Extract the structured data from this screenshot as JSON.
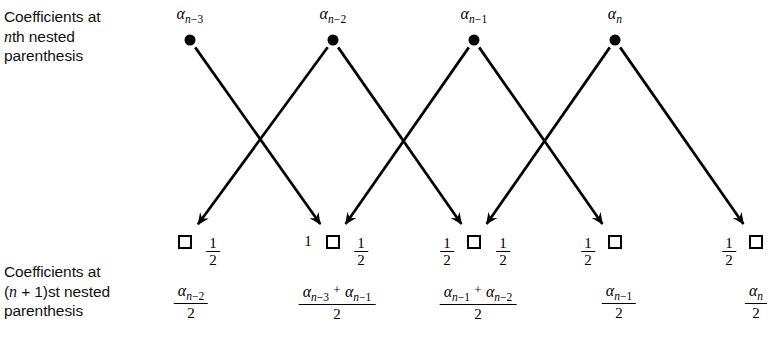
{
  "figure": {
    "type": "signal-flow-diagram",
    "title": "",
    "background": "#ffffff",
    "ink_color": "#000000",
    "width": 776,
    "height": 337
  },
  "labels": {
    "top_row": {
      "line1": "Coefficients at",
      "line2_italic": "n",
      "line2_rest": "th nested",
      "line3": "parenthesis"
    },
    "bottom_row": {
      "line1": "Coefficients at",
      "line2_pre": "(",
      "line2_italic": "n",
      "line2_rest": " + 1)st nested",
      "line3": "parenthesis"
    }
  },
  "top_nodes": [
    {
      "id": "a-n-3",
      "alpha": "α",
      "sub_n": "n",
      "sub_rest": "−3",
      "x": 190,
      "y": 40,
      "marker": "dot"
    },
    {
      "id": "a-n-2",
      "alpha": "α",
      "sub_n": "n",
      "sub_rest": "−2",
      "x": 333,
      "y": 40,
      "marker": "dot"
    },
    {
      "id": "a-n-1",
      "alpha": "α",
      "sub_n": "n",
      "sub_rest": "−1",
      "x": 474,
      "y": 40,
      "marker": "dot"
    },
    {
      "id": "a-n",
      "alpha": "α",
      "sub_n": "n",
      "sub_rest": "",
      "x": 615,
      "y": 40,
      "marker": "dot"
    }
  ],
  "bottom_nodes": [
    {
      "id": "out-1",
      "x": 185,
      "y": 242,
      "marker": "square"
    },
    {
      "id": "out-2",
      "x": 333,
      "y": 242,
      "marker": "square"
    },
    {
      "id": "out-3",
      "x": 474,
      "y": 242,
      "marker": "square"
    },
    {
      "id": "out-4",
      "x": 615,
      "y": 242,
      "marker": "square"
    },
    {
      "id": "out-5",
      "x": 756,
      "y": 242,
      "marker": "square"
    }
  ],
  "edges": [
    {
      "from": "a-n-3",
      "to": "out-2",
      "weight": "1/2"
    },
    {
      "from": "a-n-2",
      "to": "out-1",
      "weight": "1/2"
    },
    {
      "from": "a-n-2",
      "to": "out-3",
      "weight": "1/2"
    },
    {
      "from": "a-n-1",
      "to": "out-2",
      "weight": "1"
    },
    {
      "from": "a-n-1",
      "to": "out-4",
      "weight": "1/2"
    },
    {
      "from": "a-n",
      "to": "out-3",
      "weight": "1/2"
    },
    {
      "from": "a-n",
      "to": "out-5",
      "weight": "1/2"
    }
  ],
  "edge_weight_labels": [
    {
      "id": "w1",
      "x": 213,
      "y": 236,
      "numerator": "1",
      "denominator": "2",
      "side": "right-of-square-1"
    },
    {
      "id": "w2",
      "x": 308,
      "y": 242,
      "whole": "1",
      "side": "left-of-square-2"
    },
    {
      "id": "w3",
      "x": 361,
      "y": 236,
      "numerator": "1",
      "denominator": "2",
      "side": "right-of-square-2"
    },
    {
      "id": "w4",
      "x": 447,
      "y": 236,
      "numerator": "1",
      "denominator": "2",
      "side": "left-of-square-3"
    },
    {
      "id": "w5",
      "x": 503,
      "y": 236,
      "numerator": "1",
      "denominator": "2",
      "side": "right-of-square-3"
    },
    {
      "id": "w6",
      "x": 588,
      "y": 236,
      "numerator": "1",
      "denominator": "2",
      "side": "left-of-square-4"
    },
    {
      "id": "w7",
      "x": 729,
      "y": 236,
      "numerator": "1",
      "denominator": "2",
      "side": "left-of-square-5"
    }
  ],
  "results": [
    {
      "id": "res-1",
      "x": 191,
      "y": 283,
      "numerator_terms": [
        {
          "alpha": "α",
          "sub_n": "n",
          "sub_rest": "−2"
        }
      ],
      "denominator": "2"
    },
    {
      "id": "res-2",
      "x": 337,
      "y": 283,
      "numerator_terms": [
        {
          "alpha": "α",
          "sub_n": "n",
          "sub_rest": "−3"
        },
        {
          "alpha": "α",
          "sub_n": "n",
          "sub_rest": "−1"
        }
      ],
      "operator": "+",
      "denominator": "2"
    },
    {
      "id": "res-3",
      "x": 478,
      "y": 283,
      "numerator_terms": [
        {
          "alpha": "α",
          "sub_n": "n",
          "sub_rest": "−1"
        },
        {
          "alpha": "α",
          "sub_n": "n",
          "sub_rest": "−2"
        }
      ],
      "operator": "+",
      "denominator": "2"
    },
    {
      "id": "res-4",
      "x": 619,
      "y": 283,
      "numerator_terms": [
        {
          "alpha": "α",
          "sub_n": "n",
          "sub_rest": "−1"
        }
      ],
      "denominator": "2"
    },
    {
      "id": "res-5",
      "x": 756,
      "y": 283,
      "numerator_terms": [
        {
          "alpha": "α",
          "sub_n": "n",
          "sub_rest": ""
        }
      ],
      "denominator": "2"
    }
  ]
}
